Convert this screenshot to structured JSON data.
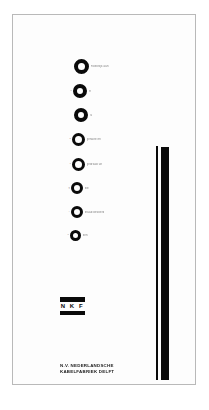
{
  "document": {
    "title": "N.V. Nederlandsche Kabelfabriek Delft advertisement card",
    "background_color": "#ffffff",
    "frame_color": "#b9b9b9",
    "ink_color": "#0a0a0a"
  },
  "rings": [
    {
      "number": "",
      "label": "moeielijk aan",
      "size": 15,
      "stroke": 4.2,
      "left": 55,
      "top": 44
    },
    {
      "number": "2",
      "label": "er",
      "size": 14,
      "stroke": 4.0,
      "left": 54,
      "top": 69
    },
    {
      "number": "",
      "label": "ra",
      "size": 14,
      "stroke": 4.0,
      "left": 55,
      "top": 93
    },
    {
      "number": "4",
      "label": "gehalte en",
      "size": 13,
      "stroke": 3.8,
      "left": 53,
      "top": 118
    },
    {
      "number": "5",
      "label": "gedraad uit",
      "size": 13,
      "stroke": 3.8,
      "left": 53,
      "top": 143
    },
    {
      "number": "g",
      "label": "die",
      "size": 12,
      "stroke": 3.6,
      "left": 52,
      "top": 167
    },
    {
      "number": "7",
      "label": "draad gevoerd",
      "size": 12,
      "stroke": 3.6,
      "left": 52,
      "top": 191
    },
    {
      "number": "8",
      "label": "den",
      "size": 11,
      "stroke": 3.4,
      "left": 51,
      "top": 215
    }
  ],
  "logo": {
    "letters": "N K F",
    "bar_top_name": "logo-bar-top",
    "bar_bottom_name": "logo-bar-bottom"
  },
  "company": {
    "line1": "N.V. NEDERLANDSCHE",
    "line2": "KABELFABRIEK DELFT"
  },
  "bars": {
    "thin_name": "vertical-rule-thin",
    "thick_name": "vertical-bar-thick"
  }
}
